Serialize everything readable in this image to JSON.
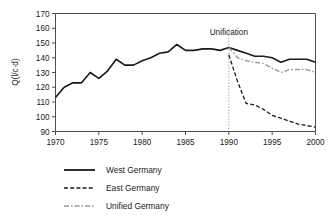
{
  "figure": {
    "background_color": "#ffffff",
    "annotation": {
      "text": "Unification",
      "year": 1990
    }
  },
  "chart_data": {
    "type": "line",
    "title": "",
    "subtitle": "",
    "xlabel": "",
    "ylabel": "Q(l/c·d)",
    "xlim": [
      1970,
      2000
    ],
    "ylim": [
      90,
      170
    ],
    "xticks": [
      1970,
      1975,
      1980,
      1985,
      1990,
      1995,
      2000
    ],
    "yticks": [
      90,
      100,
      110,
      120,
      130,
      140,
      150,
      160,
      170
    ],
    "grid": false,
    "legend_position": "below",
    "annotations": [
      {
        "text": "Unification",
        "x": 1990,
        "y": 152
      }
    ],
    "series": [
      {
        "name": "West Germany",
        "style": "solid",
        "color": "#1a1a1a",
        "width": 1.6,
        "x": [
          1970,
          1971,
          1972,
          1973,
          1974,
          1975,
          1976,
          1977,
          1978,
          1979,
          1980,
          1981,
          1982,
          1983,
          1984,
          1985,
          1986,
          1987,
          1988,
          1989,
          1990,
          1991,
          1992,
          1993,
          1994,
          1995,
          1996,
          1997,
          1998,
          1999,
          2000
        ],
        "values": [
          113,
          120,
          123,
          123,
          130,
          126,
          131,
          139,
          135,
          135,
          138,
          140,
          143,
          144,
          149,
          145,
          145,
          146,
          146,
          145,
          147,
          145,
          143,
          141,
          141,
          140,
          137,
          139,
          139,
          139,
          137
        ]
      },
      {
        "name": "East Germany",
        "style": "dashed",
        "color": "#1a1a1a",
        "width": 1.3,
        "x": [
          1990,
          1991,
          1992,
          1993,
          1994,
          1995,
          1996,
          1997,
          1998,
          1999,
          2000
        ],
        "values": [
          142,
          124,
          109,
          108,
          105,
          101,
          99,
          97,
          95,
          94,
          93
        ]
      },
      {
        "name": "Unified Germany",
        "style": "dashdot",
        "color": "#9a9a9a",
        "width": 1.4,
        "x": [
          1990,
          1991,
          1992,
          1993,
          1994,
          1995,
          1996,
          1997,
          1998,
          1999,
          2000
        ],
        "values": [
          147,
          140,
          138,
          137,
          136,
          133,
          130,
          132,
          132,
          132,
          130
        ]
      }
    ]
  },
  "legend": {
    "items": [
      {
        "label": "West Germany",
        "style": "solid",
        "color": "#1a1a1a"
      },
      {
        "label": "East Germany",
        "style": "dashed",
        "color": "#1a1a1a"
      },
      {
        "label": "Unified Germany",
        "style": "dashdot",
        "color": "#9a9a9a"
      }
    ]
  }
}
